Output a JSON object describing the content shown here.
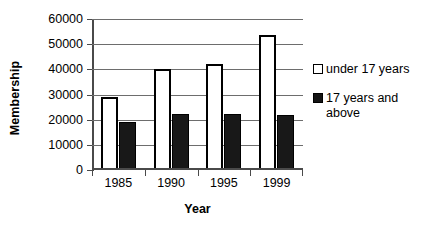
{
  "chart_data": {
    "type": "bar",
    "title": "",
    "subtitle": "",
    "xlabel": "Year",
    "ylabel": "Membership",
    "categories": [
      "1985",
      "1990",
      "1995",
      "1999"
    ],
    "series": [
      {
        "name": "under 17 years",
        "values": [
          29200,
          40000,
          42300,
          53500
        ],
        "color": "#ffffff",
        "edge_color": "#000000"
      },
      {
        "name": "17 years and above",
        "values": [
          19100,
          22200,
          22200,
          21800
        ],
        "color": "#181818",
        "edge_color": "#000000"
      }
    ],
    "ylim": [
      0,
      60000
    ],
    "ytick_values": [
      0,
      10000,
      20000,
      30000,
      40000,
      50000,
      60000
    ],
    "ytick_labels": [
      "0",
      "10000",
      "20000",
      "30000",
      "40000",
      "50000",
      "60000"
    ],
    "grid": true,
    "grid_axis": "y",
    "legend_position": "right",
    "legend_entries": [
      {
        "label": "under 17 years",
        "swatch": "light"
      },
      {
        "label": "17 years and\nabove",
        "swatch": "dark"
      }
    ]
  }
}
